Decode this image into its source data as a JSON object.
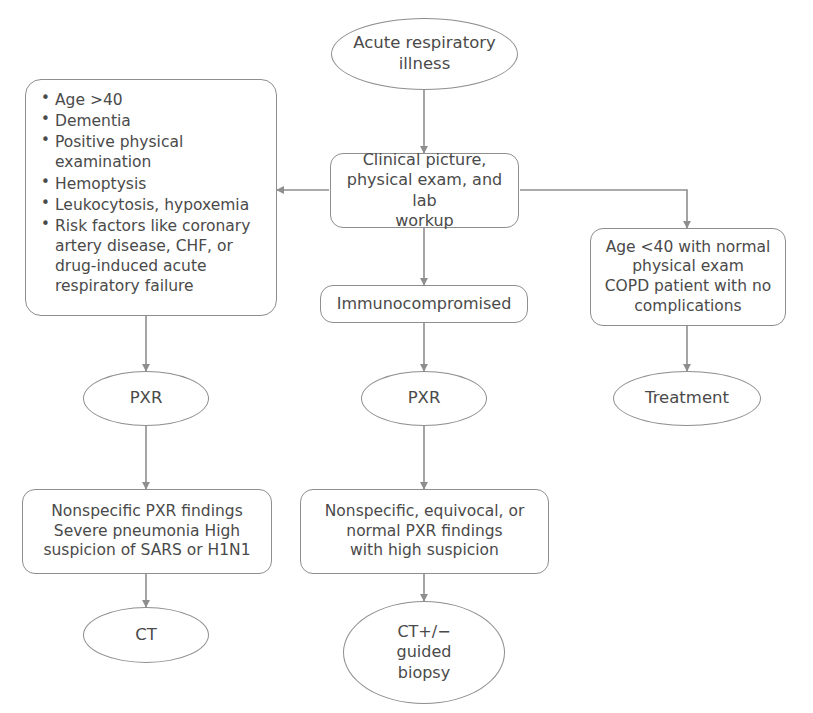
{
  "figure": {
    "type": "flowchart",
    "colors": {
      "stroke": "#8e8e8e",
      "text": "#4a4a4a",
      "background": "#ffffff"
    }
  },
  "nodes": {
    "acute_respiratory_illness": {
      "label": "Acute respiratory\nillness",
      "shape": "oval"
    },
    "clinical_picture": {
      "label": "Clinical picture,\nphysical exam, and lab\nworkup",
      "shape": "box"
    },
    "risk_factors": {
      "shape": "box",
      "bullets": [
        "Age >40",
        "Dementia",
        "Positive physical\nexamination",
        "Hemoptysis",
        "Leukocytosis, hypoxemia",
        "Risk factors like coronary\nartery disease, CHF, or\ndrug-induced acute\nrespiratory failure"
      ]
    },
    "immunocompromised": {
      "label": "Immunocompromised",
      "shape": "box"
    },
    "low_risk": {
      "label": "Age <40 with normal\nphysical exam\nCOPD patient with no\ncomplications",
      "shape": "box"
    },
    "pxr_left": {
      "label": "PXR",
      "shape": "oval"
    },
    "pxr_middle": {
      "label": "PXR",
      "shape": "oval"
    },
    "treatment": {
      "label": "Treatment",
      "shape": "oval"
    },
    "findings_left": {
      "label": "Nonspecific PXR findings\nSevere pneumonia High\nsuspicion of SARS or H1N1",
      "shape": "box"
    },
    "findings_middle": {
      "label": "Nonspecific, equivocal, or\nnormal PXR findings\nwith high suspicion",
      "shape": "box"
    },
    "ct_left": {
      "label": "CT",
      "shape": "oval"
    },
    "ct_middle": {
      "label": "CT+/−\nguided\nbiopsy",
      "shape": "oval"
    }
  },
  "edges": [
    {
      "from": "acute_respiratory_illness",
      "to": "clinical_picture",
      "direction": "down"
    },
    {
      "from": "clinical_picture",
      "to": "risk_factors",
      "direction": "left"
    },
    {
      "from": "clinical_picture",
      "to": "immunocompromised",
      "direction": "down"
    },
    {
      "from": "clinical_picture",
      "to": "low_risk",
      "direction": "right-down"
    },
    {
      "from": "risk_factors",
      "to": "pxr_left",
      "direction": "down"
    },
    {
      "from": "immunocompromised",
      "to": "pxr_middle",
      "direction": "down"
    },
    {
      "from": "low_risk",
      "to": "treatment",
      "direction": "down"
    },
    {
      "from": "pxr_left",
      "to": "findings_left",
      "direction": "down"
    },
    {
      "from": "pxr_middle",
      "to": "findings_middle",
      "direction": "down"
    },
    {
      "from": "findings_left",
      "to": "ct_left",
      "direction": "down"
    },
    {
      "from": "findings_middle",
      "to": "ct_middle",
      "direction": "down"
    }
  ]
}
